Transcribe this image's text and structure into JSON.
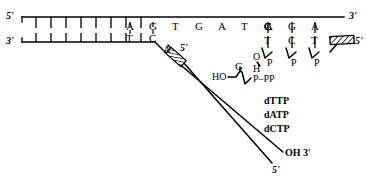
{
  "figure": {
    "line_color": "#000000",
    "background": "#ffffff"
  },
  "strands": {
    "top": {
      "five_prime_label": "5'",
      "three_prime_label": "3'",
      "bases": [
        "A",
        "G",
        "T",
        "G",
        "A",
        "T",
        "C",
        "A",
        "G",
        "A"
      ],
      "plain_tick_count": 8
    },
    "bottom": {
      "three_prime_label": "3'",
      "bases": [
        "T",
        "C"
      ],
      "plain_tick_count": 8
    },
    "displaced": {
      "five_prime_label": "5'",
      "base_label": "A",
      "block_label": "hatched-block"
    },
    "nascent": {
      "three_prime_label": "OH 3'",
      "five_prime_label": "5'"
    },
    "primer": {
      "five_prime_label": "5'",
      "bases": [
        "T",
        "C",
        "T"
      ],
      "block_label": "hatched-block"
    }
  },
  "chemistry": {
    "hydroxyl_left": "HO",
    "o_label": "O",
    "h_label": "H",
    "incoming_base": "G",
    "triphosphate": "P–PP",
    "phosphate_label": "P",
    "phosphates": [
      "P",
      "P",
      "P"
    ]
  },
  "nucleotides": {
    "items": [
      "dTTP",
      "dATP",
      "dCTP"
    ]
  }
}
